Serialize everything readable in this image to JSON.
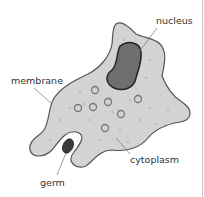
{
  "diagram": {
    "labels": {
      "nucleus": "nucleus",
      "membrane": "membrane",
      "germ": "germ",
      "cytoplasm": "cytoplasm"
    },
    "colors": {
      "cytoplasm_fill": "#d3d3d3",
      "outline": "#555555",
      "nucleus_fill": "#6e6e6e",
      "germ_fill": "#3a3a3a",
      "leader_line": "#777777"
    }
  }
}
